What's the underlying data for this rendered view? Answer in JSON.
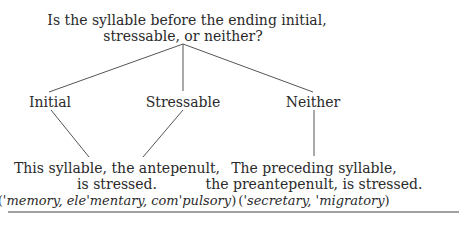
{
  "question": {
    "line1": "Is the syllable before the ending initial,",
    "line2": "stressable, or neither?"
  },
  "branches": [
    {
      "label": "Initial"
    },
    {
      "label": "Stressable"
    },
    {
      "label": "Neither"
    }
  ],
  "outcomes": [
    {
      "line1": "This syllable, the antepenult,",
      "line2": "is stressed.",
      "examples_open": "(",
      "examples": "'memory, ele'mentary, com'pulsory",
      "examples_close": ")"
    },
    {
      "line1": "The preceding syllable,",
      "line2": "the preantepenult, is stressed.",
      "examples_open": "(",
      "examples": "'secretary, 'migratory",
      "examples_close": ")"
    }
  ],
  "colors": {
    "text": "#2a2a2a",
    "line": "#555555"
  }
}
